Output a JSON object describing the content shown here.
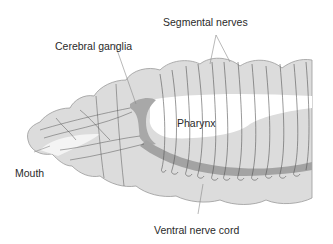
{
  "diagram": {
    "labels": {
      "segmental_nerves": "Segmental nerves",
      "cerebral_ganglia": "Cerebral ganglia",
      "pharynx": "Pharynx",
      "mouth": "Mouth",
      "ventral_nerve_cord": "Ventral nerve cord"
    },
    "colors": {
      "body_fill": "#dcdcdc",
      "body_outline": "#9a9a9a",
      "pharynx_fill": "#ffffff",
      "ganglia_fill": "#a8a8a8",
      "nerve_cord": "#a3a3a3",
      "nerve_line": "#555555",
      "label_text": "#2a2a2a"
    }
  }
}
